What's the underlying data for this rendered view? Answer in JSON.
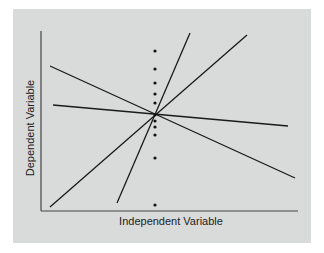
{
  "chart_data": {
    "type": "line",
    "title": "",
    "xlabel": "Independent Variable",
    "ylabel": "Dependent Variable",
    "grid": false,
    "legend": null,
    "axes_ticks": false,
    "background_color": "#d9dbdb",
    "line_color": "#1a1a1a",
    "pixel_frame": {
      "origin": [
        41,
        211
      ],
      "x_end": 298,
      "y_top": 31
    },
    "lines": [
      {
        "name": "steep-positive",
        "x1": 117,
        "y1": 203,
        "x2": 190,
        "y2": 33
      },
      {
        "name": "moderate-positive",
        "x1": 50,
        "y1": 207,
        "x2": 247,
        "y2": 35
      },
      {
        "name": "moderate-negative",
        "x1": 50,
        "y1": 66,
        "x2": 295,
        "y2": 178
      },
      {
        "name": "shallow-negative",
        "x1": 53,
        "y1": 105,
        "x2": 288,
        "y2": 126
      }
    ],
    "points": {
      "x": 155,
      "y": [
        51,
        69,
        83,
        94,
        103,
        115,
        121,
        127,
        135,
        158,
        205
      ]
    }
  }
}
